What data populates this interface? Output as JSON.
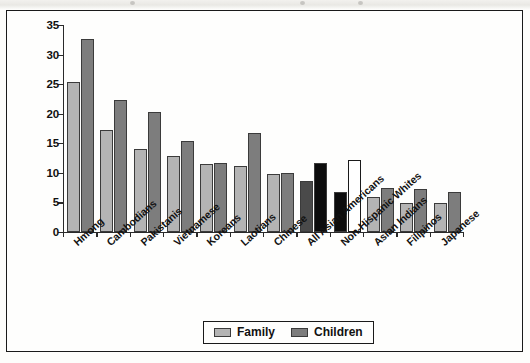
{
  "figure": {
    "background_color": "#fefefd",
    "frame_color": "#1a1a1a"
  },
  "legend": {
    "position": "bottom-center",
    "entries": [
      {
        "label": "Family",
        "color": "#b4b4b4",
        "swatch_name": "legend-swatch-family"
      },
      {
        "label": "Children",
        "color": "#7d7d7d",
        "swatch_name": "legend-swatch-children"
      }
    ]
  },
  "chart_data": {
    "type": "bar",
    "title": "",
    "xlabel": "",
    "ylabel": "",
    "ylim": [
      0,
      35
    ],
    "yticks": [
      0,
      5,
      10,
      15,
      20,
      25,
      30,
      35
    ],
    "grid": false,
    "legend_position": "bottom-center",
    "categories": [
      "Hmong",
      "Cambodians",
      "Pakistanis",
      "Vietnamese",
      "Koreans",
      "Laotians",
      "Chinese",
      "All Asian Americans",
      "Non-Hispanic Whites",
      "Asian Indians",
      "Filipinos",
      "Japanese"
    ],
    "series": [
      {
        "name": "Family",
        "values": [
          25.3,
          17.2,
          14.1,
          12.8,
          11.5,
          11.2,
          9.8,
          8.7,
          6.7,
          6.0,
          4.9,
          4.9
        ]
      },
      {
        "name": "Children",
        "values": [
          32.7,
          22.4,
          20.3,
          15.4,
          11.7,
          16.8,
          9.9,
          11.6,
          12.1,
          7.4,
          7.3,
          6.8
        ]
      }
    ],
    "bar_styles": {
      "Family": [
        "light",
        "light",
        "light",
        "light",
        "light",
        "light",
        "light",
        "dark",
        "black",
        "light",
        "light",
        "light"
      ],
      "Children": [
        "mid",
        "mid",
        "mid",
        "mid",
        "mid",
        "mid",
        "mid",
        "black",
        "white",
        "mid",
        "mid",
        "mid"
      ]
    }
  }
}
